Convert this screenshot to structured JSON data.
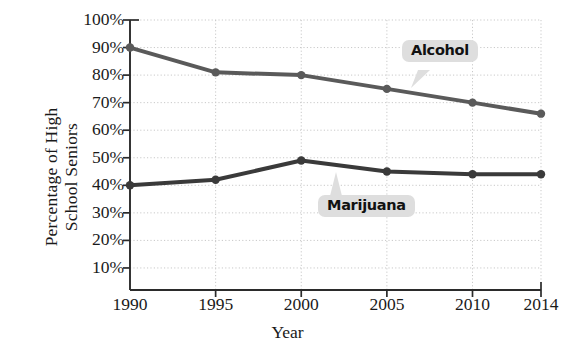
{
  "chart_data": {
    "type": "line",
    "title": "",
    "xlabel": "Year",
    "ylabel": "Percentage of High School Seniors",
    "x": [
      1990,
      1995,
      2000,
      2005,
      2010,
      2014
    ],
    "xtick_labels": [
      "1990",
      "1995",
      "2000",
      "2005",
      "2010",
      "2014"
    ],
    "ytick_labels": [
      "100%",
      "90%",
      "80%",
      "70%",
      "60%",
      "50%",
      "40%",
      "30%",
      "20%",
      "10%"
    ],
    "ytick_values": [
      100,
      90,
      80,
      70,
      60,
      50,
      40,
      30,
      20,
      10
    ],
    "xlim": [
      1990,
      2014
    ],
    "ylim": [
      0,
      100
    ],
    "grid": true,
    "legend_position": "inline-callouts",
    "series": [
      {
        "name": "Alcohol",
        "color": "#5a5a5a",
        "values": [
          90,
          81,
          80,
          75,
          70,
          66
        ]
      },
      {
        "name": "Marijuana",
        "color": "#3a3a3a",
        "values": [
          40,
          42,
          49,
          45,
          44,
          44
        ]
      }
    ],
    "annotations": [
      {
        "text": "Alcohol",
        "series": "Alcohol"
      },
      {
        "text": "Marijuana",
        "series": "Marijuana"
      }
    ]
  },
  "axis": {
    "y_title_line1": "Percentage of High",
    "y_title_line2": "School Seniors",
    "x_title": "Year"
  },
  "colors": {
    "axis": "#2b2b2b",
    "grid": "#c9c9c9",
    "alcohol_line": "#5a5a5a",
    "marijuana_line": "#3a3a3a",
    "callout_bg": "#dedede",
    "callout_text": "#111111"
  }
}
